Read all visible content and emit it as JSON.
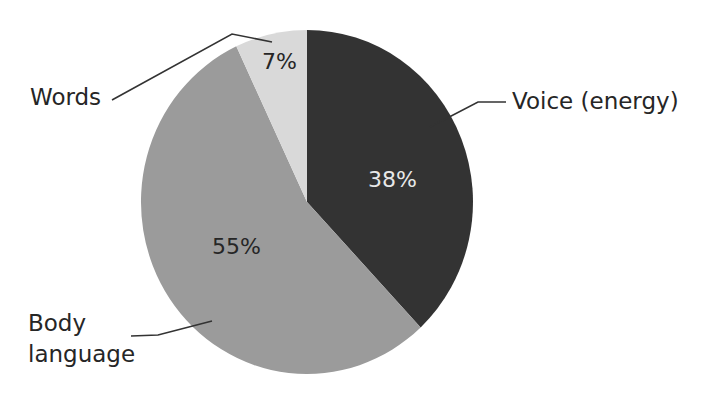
{
  "chart_data": {
    "type": "pie",
    "title": "",
    "categories": [
      "Voice (energy)",
      "Body language",
      "Words"
    ],
    "values": [
      38,
      55,
      7
    ],
    "unit": "%",
    "data_labels": [
      "38%",
      "55%",
      "7%"
    ],
    "colors": [
      "#333333",
      "#9b9b9b",
      "#d9d9d9"
    ],
    "start_angle": "12 o'clock",
    "direction": "clockwise",
    "legend": "none (leader-line callouts)"
  },
  "labels": {
    "voice": "Voice (energy)",
    "body_line1": "Body",
    "body_line2": "language",
    "words": "Words"
  },
  "pct": {
    "voice": "38%",
    "body": "55%",
    "words": "7%"
  }
}
